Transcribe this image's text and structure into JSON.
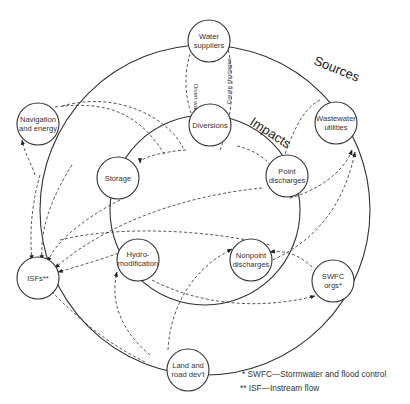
{
  "diagram": {
    "rings": {
      "outer_label": "Sources",
      "inner_label": "Impacts"
    },
    "nodes": {
      "water_suppliers": [
        "Water",
        "suppliers"
      ],
      "navigation_energy": [
        "Navigation",
        "and energy"
      ],
      "wastewater_utilities": [
        "Wastewater",
        "utilities"
      ],
      "diversions": [
        "Diversions"
      ],
      "storage": [
        "Storage"
      ],
      "point_discharges": [
        "Point",
        "discharges"
      ],
      "isfs": [
        "ISFs**"
      ],
      "hydromodification": [
        "Hydro-",
        "modification"
      ],
      "nonpoint_discharges": [
        "Nonpoint",
        "discharges"
      ],
      "swfc_orgs": [
        "SWFC",
        "orgs*"
      ],
      "land_road_devt": [
        "Land and",
        "road dev't"
      ]
    },
    "edge_labels": {
      "divert_water": "Divert water",
      "create_shortages": "Create shortages"
    },
    "legend": [
      "*  SWFC—Stormwater and flood control",
      "** ISF—Instream flow"
    ]
  }
}
